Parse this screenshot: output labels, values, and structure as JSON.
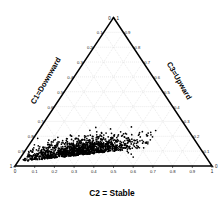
{
  "chart_data": {
    "type": "scatter",
    "plot_kind": "ternary",
    "title": "",
    "axes": {
      "bottom": {
        "label": "C2 = Stable",
        "ticks": [
          "0",
          "0.1",
          "0.2",
          "0.3",
          "0.4",
          "0.5",
          "0.6",
          "0.7",
          "0.8",
          "0.9",
          "1"
        ],
        "range": [
          0,
          1
        ],
        "direction": "left-to-right"
      },
      "left": {
        "label": "C1=Downward",
        "ticks": [
          "0",
          "0.1",
          "0.2",
          "0.3",
          "0.4",
          "0.5",
          "0.6",
          "0.7",
          "0.8",
          "0.9",
          "1"
        ],
        "range": [
          0,
          1
        ],
        "direction": "apex-to-bottom-left"
      },
      "right": {
        "label": "C3=Upward",
        "ticks": [
          "0",
          "0.1",
          "0.2",
          "0.3",
          "0.4",
          "0.5",
          "0.6",
          "0.7",
          "0.8",
          "0.9",
          "1"
        ],
        "range": [
          0,
          1
        ],
        "direction": "bottom-right-to-apex"
      }
    },
    "corners": {
      "apex_left_value": "0",
      "apex_right_value": "1",
      "bottom_left_left_value": "1",
      "bottom_left_bottom_value": "0",
      "bottom_right_bottom_value": "1",
      "bottom_right_right_value": "0"
    },
    "grid": true,
    "grid_color": "#bdbdbd",
    "legend": "none",
    "marker_color": "#000000",
    "series": [
      {
        "name": "samples",
        "n_points": 1400,
        "description": "dense cluster concentrated at low C3 (upward), spanning C2 from about 0.05 to 0.55 and C1 from about 0.35 to 0.95",
        "cluster": {
          "c2_center": 0.27,
          "c3_center": 0.07,
          "c2_spread": 0.13,
          "c3_spread": 0.055,
          "c2_range": [
            0.02,
            0.6
          ],
          "c3_range": [
            0.0,
            0.28
          ]
        }
      }
    ]
  },
  "labels": {
    "bottom_axis_title": "C2 = Stable",
    "left_axis_title": "C1=Downward",
    "right_axis_title": "C3=Upward"
  },
  "colors": {
    "background": "#ffffff",
    "frame": "#000000",
    "grid": "#bdbdbd",
    "marker": "#000000",
    "text": "#1a1a1a"
  }
}
